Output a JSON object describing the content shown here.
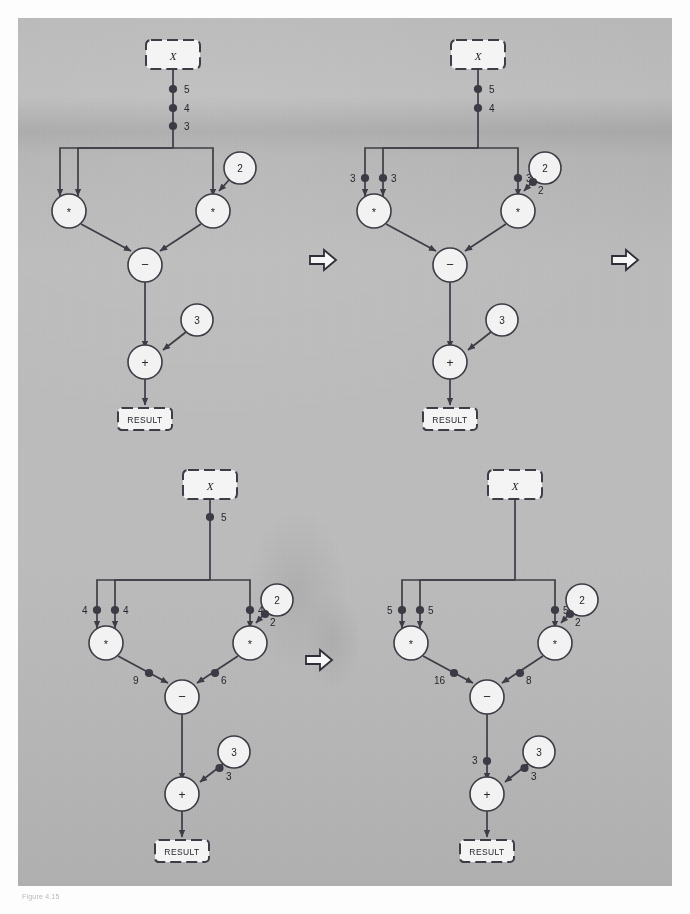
{
  "figure": {
    "caption": "Figure 4.15",
    "node_labels": {
      "input": "X",
      "output": "RESULT",
      "mul": "*",
      "sub": "−",
      "add": "+"
    },
    "arrow_icon": "right-block-arrow"
  },
  "diagrams": [
    {
      "id": "step-1",
      "position": "top-left",
      "input_box": "X",
      "result_box": "RESULT",
      "constants": [
        "2",
        "3"
      ],
      "operators": [
        "*",
        "*",
        "−",
        "+"
      ],
      "tokens": [
        {
          "arc": "x-trunk",
          "value": "5"
        },
        {
          "arc": "x-trunk",
          "value": "4"
        },
        {
          "arc": "x-trunk",
          "value": "3"
        }
      ]
    },
    {
      "id": "step-2",
      "position": "top-right",
      "input_box": "X",
      "result_box": "RESULT",
      "constants": [
        "2",
        "3"
      ],
      "operators": [
        "*",
        "*",
        "−",
        "+"
      ],
      "tokens": [
        {
          "arc": "x-trunk",
          "value": "5"
        },
        {
          "arc": "x-trunk",
          "value": "4"
        },
        {
          "arc": "to-mul-left-a",
          "value": "3"
        },
        {
          "arc": "to-mul-left-b",
          "value": "3"
        },
        {
          "arc": "to-mul-right-a",
          "value": "3"
        },
        {
          "arc": "const2-to-mul-right",
          "value": "2"
        }
      ]
    },
    {
      "id": "step-3",
      "position": "bottom-left",
      "input_box": "X",
      "result_box": "RESULT",
      "constants": [
        "2",
        "3"
      ],
      "operators": [
        "*",
        "*",
        "−",
        "+"
      ],
      "tokens": [
        {
          "arc": "x-trunk",
          "value": "5"
        },
        {
          "arc": "to-mul-left-a",
          "value": "4"
        },
        {
          "arc": "to-mul-left-b",
          "value": "4"
        },
        {
          "arc": "to-mul-right-a",
          "value": "4"
        },
        {
          "arc": "const2-to-mul-right",
          "value": "2"
        },
        {
          "arc": "mul-left-to-sub",
          "value": "9"
        },
        {
          "arc": "mul-right-to-sub",
          "value": "6"
        },
        {
          "arc": "const3-to-add",
          "value": "3"
        }
      ]
    },
    {
      "id": "step-4",
      "position": "bottom-right",
      "input_box": "X",
      "result_box": "RESULT",
      "constants": [
        "2",
        "3"
      ],
      "operators": [
        "*",
        "*",
        "−",
        "+"
      ],
      "tokens": [
        {
          "arc": "to-mul-left-a",
          "value": "5"
        },
        {
          "arc": "to-mul-left-b",
          "value": "5"
        },
        {
          "arc": "to-mul-right-a",
          "value": "5"
        },
        {
          "arc": "const2-to-mul-right",
          "value": "2"
        },
        {
          "arc": "mul-left-to-sub",
          "value": "16"
        },
        {
          "arc": "mul-right-to-sub",
          "value": "8"
        },
        {
          "arc": "sub-to-add",
          "value": "3"
        },
        {
          "arc": "const3-to-add",
          "value": "3"
        }
      ]
    }
  ],
  "colors": {
    "plate": "#bbbbbb",
    "ink": "#3c3c46",
    "node_fill": "#f2f2f2",
    "token": "#3a3a44"
  }
}
